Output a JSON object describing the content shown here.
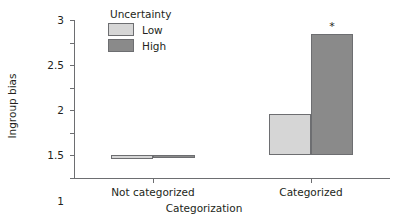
{
  "chart_data": {
    "type": "bar",
    "title": "",
    "xlabel": "Categorization",
    "ylabel": "Ingroup bias",
    "categories": [
      "Not categorized",
      "Categorized"
    ],
    "series": [
      {
        "name": "Low",
        "values": [
          -0.07,
          0.92
        ],
        "color": "#d6d6d6"
      },
      {
        "name": "High",
        "values": [
          -0.02,
          2.7
        ],
        "color": "#8a8a8a"
      }
    ],
    "legend": {
      "title": "Uncertainty",
      "entries": [
        "Low",
        "High"
      ],
      "position": "top-left-inside"
    },
    "ylim": [
      -0.5,
      3
    ],
    "yticks": [
      3,
      2.5,
      2,
      1.5,
      1,
      0.5,
      0,
      -0.5
    ],
    "ytick_labels": [
      "3",
      "2.5",
      "2",
      "1.5",
      "1",
      "0.5",
      "0",
      "−0.5"
    ],
    "grid": false,
    "annotations": [
      {
        "text": "*",
        "series": "High",
        "category": "Categorized",
        "value": 2.7
      }
    ],
    "bar_edge_color": "#6d6e71",
    "axis_color": "#6d6e71",
    "background": "#ffffff"
  }
}
